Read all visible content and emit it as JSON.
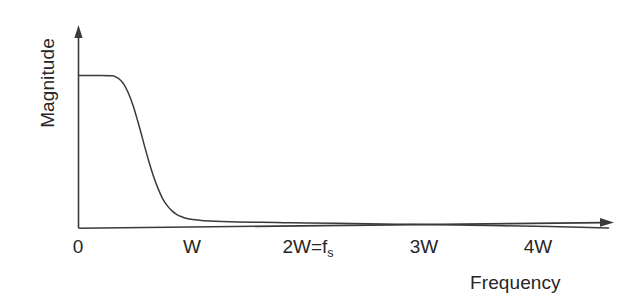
{
  "figure": {
    "background_color": "#ffffff",
    "line_color": "#3a3a3a",
    "text_color": "#262626"
  },
  "chart_data": {
    "type": "line",
    "title": "",
    "subtitle": "",
    "xlabel": "Frequency",
    "ylabel": "Magnitude",
    "legend": [],
    "legend_position": "none",
    "grid": false,
    "annotations": [],
    "xlim": [
      0,
      4.65
    ],
    "ylim": [
      0,
      1.33
    ],
    "xticks": [
      0,
      1,
      2,
      3,
      4
    ],
    "xticklabels": [
      "0",
      "W",
      "2W=f_s",
      "3W",
      "4W"
    ],
    "yticks": [],
    "yticklabels": [],
    "axis_arrows": {
      "x": true,
      "y": true
    },
    "series": [
      {
        "name": "Anti-aliasing lowpass filter magnitude response",
        "x": [
          0.0,
          0.1,
          0.2,
          0.3,
          0.31,
          0.33,
          0.36,
          0.4,
          0.44,
          0.48,
          0.52,
          0.55,
          0.58,
          0.62,
          0.66,
          0.7,
          0.74,
          0.78,
          0.82,
          0.86,
          0.9,
          0.95,
          1.0,
          1.1,
          1.2,
          1.4,
          1.6,
          1.8,
          2.0,
          2.4,
          2.8,
          3.2,
          3.6,
          4.0,
          4.4,
          4.65
        ],
        "y": [
          1.0,
          1.0,
          1.0,
          0.998,
          0.996,
          0.99,
          0.975,
          0.94,
          0.88,
          0.8,
          0.7,
          0.62,
          0.535,
          0.43,
          0.335,
          0.255,
          0.19,
          0.145,
          0.112,
          0.09,
          0.075,
          0.062,
          0.055,
          0.048,
          0.044,
          0.04,
          0.037,
          0.035,
          0.033,
          0.029,
          0.025,
          0.021,
          0.016,
          0.011,
          0.005,
          0.0
        ]
      }
    ]
  },
  "axes": {
    "y_axis_label": "Magnitude",
    "x_axis_label": "Frequency",
    "ticks": [
      {
        "label": "0",
        "sub": "",
        "x_px": 78
      },
      {
        "label": "W",
        "sub": "",
        "x_px": 192
      },
      {
        "label": "2W=f",
        "sub": "s",
        "x_px": 308
      },
      {
        "label": "3W",
        "sub": "",
        "x_px": 424
      },
      {
        "label": "4W",
        "sub": "",
        "x_px": 538
      }
    ]
  }
}
